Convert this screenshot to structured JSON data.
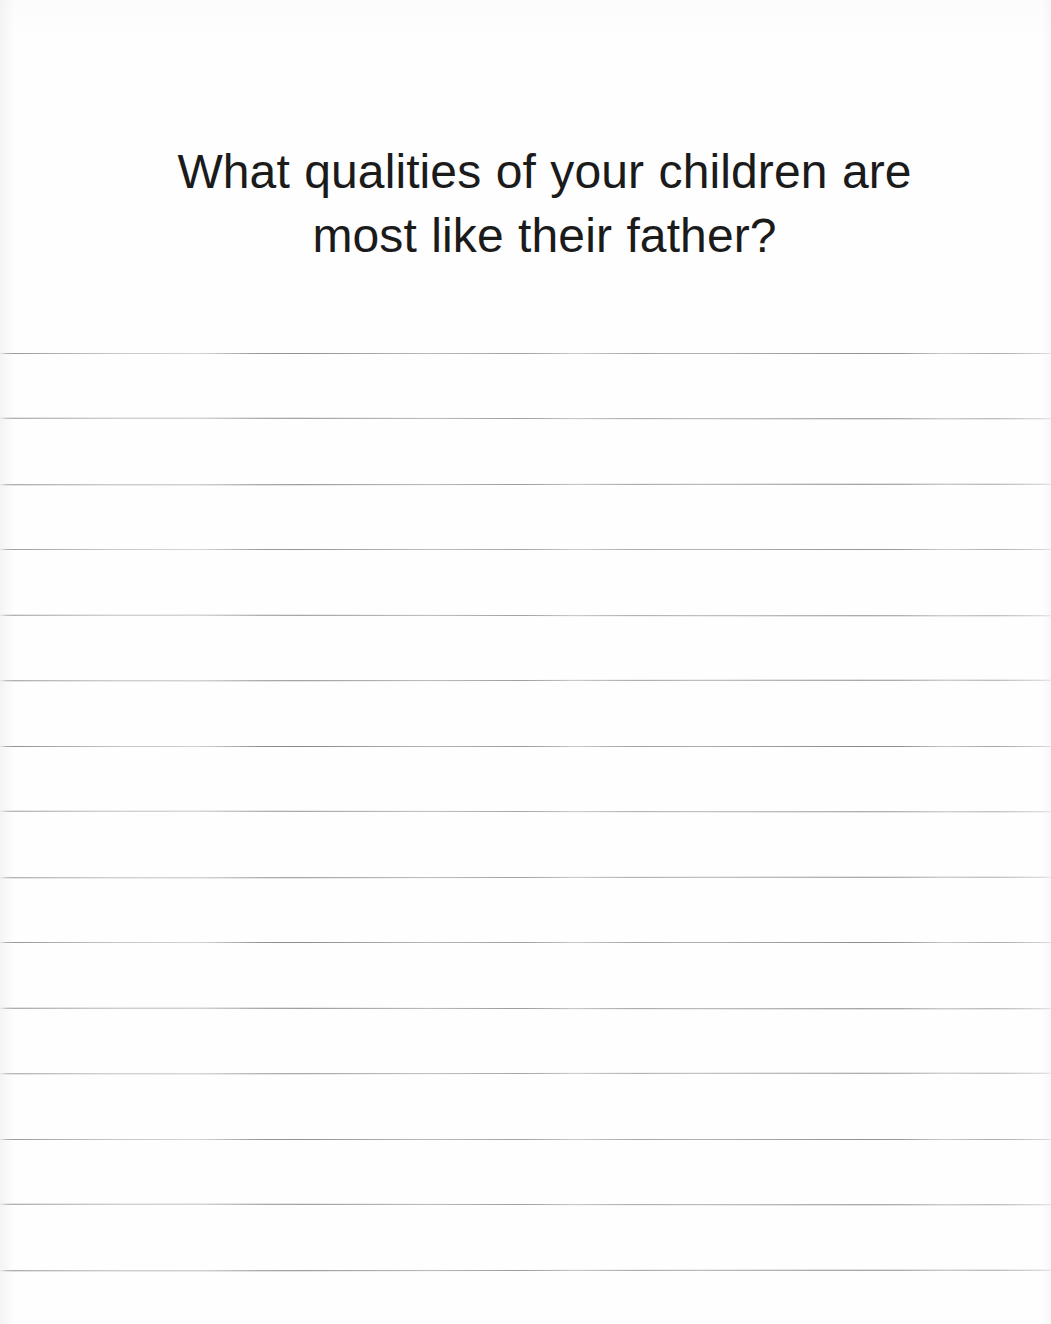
{
  "page": {
    "background_color": "#fefefe",
    "width": 1051,
    "height": 1324,
    "type": "journal-prompt-page"
  },
  "prompt": {
    "question": "What qualities of your children are most like their father?",
    "text_color": "#1b1b1b",
    "font_size_px": 48,
    "alignment": "center",
    "line_1": "What qualities of your children are most",
    "line_2": "like their father?"
  },
  "writing_area": {
    "line_color": "#838388",
    "line_count": 15,
    "line_spacing_px": 65.5,
    "first_line_y": 353,
    "last_line_y": 1270,
    "lines": [
      {
        "index": 1,
        "y": 353
      },
      {
        "index": 2,
        "y": 418
      },
      {
        "index": 3,
        "y": 484
      },
      {
        "index": 4,
        "y": 549
      },
      {
        "index": 5,
        "y": 615
      },
      {
        "index": 6,
        "y": 680
      },
      {
        "index": 7,
        "y": 746
      },
      {
        "index": 8,
        "y": 811
      },
      {
        "index": 9,
        "y": 877
      },
      {
        "index": 10,
        "y": 942
      },
      {
        "index": 11,
        "y": 1008
      },
      {
        "index": 12,
        "y": 1073
      },
      {
        "index": 13,
        "y": 1139
      },
      {
        "index": 14,
        "y": 1204
      },
      {
        "index": 15,
        "y": 1270
      }
    ]
  }
}
